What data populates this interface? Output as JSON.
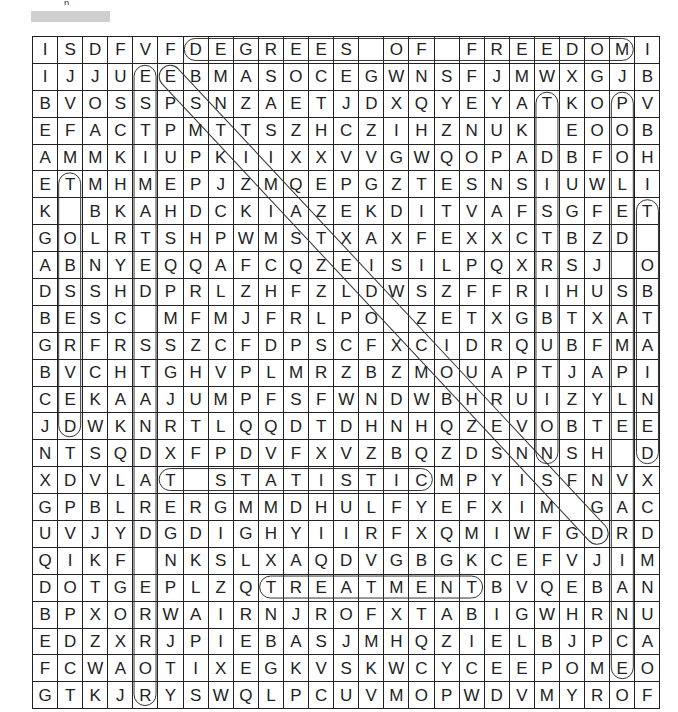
{
  "header": {
    "title_partial": "p",
    "title_placeholder_bar": true
  },
  "puzzle": {
    "type": "word-search",
    "rows": 25,
    "cols": 25,
    "grid": [
      [
        "I",
        "S",
        "D",
        "F",
        "V",
        "F",
        "D",
        "E",
        "G",
        "R",
        "E",
        "E",
        "S",
        "",
        "O",
        "F",
        "",
        "F",
        "R",
        "E",
        "E",
        "D",
        "O",
        "M",
        "I"
      ],
      [
        "I",
        "J",
        "J",
        "U",
        "E",
        "E",
        "B",
        "M",
        "A",
        "S",
        "O",
        "C",
        "E",
        "G",
        "W",
        "N",
        "S",
        "F",
        "J",
        "M",
        "W",
        "X",
        "G",
        "J",
        "B"
      ],
      [
        "B",
        "V",
        "O",
        "S",
        "S",
        "P",
        "S",
        "N",
        "Z",
        "A",
        "E",
        "T",
        "J",
        "D",
        "X",
        "Q",
        "Y",
        "E",
        "Y",
        "A",
        "T",
        "K",
        "O",
        "P",
        "V"
      ],
      [
        "E",
        "F",
        "A",
        "C",
        "T",
        "P",
        "M",
        "T",
        "T",
        "S",
        "Z",
        "H",
        "C",
        "Z",
        "I",
        "H",
        "Z",
        "N",
        "U",
        "K",
        "",
        "E",
        "O",
        "O",
        "B"
      ],
      [
        "A",
        "M",
        "M",
        "K",
        "I",
        "U",
        "P",
        "K",
        "I",
        "I",
        "X",
        "X",
        "V",
        "V",
        "G",
        "W",
        "Q",
        "O",
        "P",
        "A",
        "D",
        "B",
        "F",
        "O",
        "H"
      ],
      [
        "E",
        "T",
        "M",
        "H",
        "M",
        "E",
        "P",
        "J",
        "Z",
        "M",
        "Q",
        "E",
        "P",
        "G",
        "Z",
        "T",
        "E",
        "S",
        "N",
        "S",
        "I",
        "U",
        "W",
        "L",
        "I"
      ],
      [
        "K",
        "",
        "B",
        "K",
        "A",
        "H",
        "D",
        "C",
        "K",
        "I",
        "A",
        "Z",
        "E",
        "K",
        "D",
        "I",
        "T",
        "V",
        "A",
        "F",
        "S",
        "G",
        "F",
        "E",
        "T"
      ],
      [
        "G",
        "O",
        "L",
        "R",
        "T",
        "S",
        "H",
        "P",
        "W",
        "M",
        "S",
        "T",
        "X",
        "A",
        "X",
        "F",
        "E",
        "X",
        "X",
        "C",
        "T",
        "B",
        "Z",
        "D",
        ""
      ],
      [
        "A",
        "B",
        "N",
        "Y",
        "E",
        "Q",
        "Q",
        "A",
        "F",
        "C",
        "Q",
        "Z",
        "E",
        "I",
        "S",
        "I",
        "L",
        "P",
        "Q",
        "X",
        "R",
        "S",
        "J",
        "",
        "O"
      ],
      [
        "D",
        "S",
        "S",
        "H",
        "D",
        "P",
        "R",
        "L",
        "Z",
        "H",
        "F",
        "Z",
        "L",
        "D",
        "W",
        "S",
        "Z",
        "F",
        "F",
        "R",
        "I",
        "H",
        "U",
        "S",
        "B"
      ],
      [
        "B",
        "E",
        "S",
        "C",
        "",
        "M",
        "F",
        "M",
        "J",
        "F",
        "R",
        "L",
        "P",
        "O",
        "",
        "Z",
        "E",
        "T",
        "X",
        "G",
        "B",
        "T",
        "X",
        "A",
        "T"
      ],
      [
        "G",
        "R",
        "F",
        "R",
        "S",
        "S",
        "Z",
        "C",
        "F",
        "D",
        "P",
        "S",
        "C",
        "F",
        "X",
        "C",
        "I",
        "D",
        "R",
        "Q",
        "U",
        "B",
        "F",
        "M",
        "A"
      ],
      [
        "B",
        "V",
        "C",
        "H",
        "T",
        "G",
        "H",
        "V",
        "P",
        "L",
        "M",
        "R",
        "Z",
        "B",
        "Z",
        "M",
        "O",
        "U",
        "A",
        "P",
        "T",
        "J",
        "A",
        "P",
        "I"
      ],
      [
        "C",
        "E",
        "K",
        "A",
        "A",
        "J",
        "U",
        "M",
        "P",
        "F",
        "S",
        "F",
        "W",
        "N",
        "D",
        "W",
        "B",
        "H",
        "R",
        "U",
        "I",
        "Z",
        "Y",
        "L",
        "N"
      ],
      [
        "J",
        "D",
        "W",
        "K",
        "N",
        "R",
        "T",
        "L",
        "Q",
        "Q",
        "D",
        "T",
        "D",
        "H",
        "N",
        "H",
        "Q",
        "Z",
        "E",
        "V",
        "O",
        "B",
        "T",
        "E",
        "E"
      ],
      [
        "N",
        "T",
        "S",
        "Q",
        "D",
        "X",
        "F",
        "P",
        "D",
        "V",
        "F",
        "X",
        "V",
        "Z",
        "B",
        "Q",
        "Z",
        "D",
        "S",
        "N",
        "N",
        "S",
        "H",
        "",
        "D"
      ],
      [
        "X",
        "D",
        "V",
        "L",
        "A",
        "T",
        "",
        "S",
        "T",
        "A",
        "T",
        "I",
        "S",
        "T",
        "I",
        "C",
        "M",
        "P",
        "Y",
        "I",
        "S",
        "F",
        "N",
        "V",
        "X"
      ],
      [
        "G",
        "P",
        "B",
        "L",
        "R",
        "E",
        "R",
        "G",
        "M",
        "M",
        "D",
        "H",
        "U",
        "L",
        "F",
        "Y",
        "E",
        "F",
        "X",
        "I",
        "M",
        "",
        "G",
        "A",
        "C"
      ],
      [
        "U",
        "V",
        "J",
        "Y",
        "D",
        "G",
        "D",
        "I",
        "G",
        "H",
        "Y",
        "I",
        "I",
        "R",
        "F",
        "X",
        "Q",
        "M",
        "I",
        "W",
        "F",
        "G",
        "D",
        "R",
        "D"
      ],
      [
        "Q",
        "I",
        "K",
        "F",
        "",
        "N",
        "K",
        "S",
        "L",
        "X",
        "A",
        "Q",
        "D",
        "V",
        "G",
        "B",
        "G",
        "K",
        "C",
        "E",
        "F",
        "V",
        "J",
        "I",
        "M"
      ],
      [
        "D",
        "O",
        "T",
        "G",
        "E",
        "P",
        "L",
        "Z",
        "Q",
        "T",
        "R",
        "E",
        "A",
        "T",
        "M",
        "E",
        "N",
        "T",
        "B",
        "V",
        "Q",
        "E",
        "B",
        "A",
        "N"
      ],
      [
        "B",
        "P",
        "X",
        "O",
        "R",
        "W",
        "A",
        "I",
        "R",
        "N",
        "J",
        "R",
        "O",
        "F",
        "X",
        "T",
        "A",
        "B",
        "I",
        "G",
        "W",
        "H",
        "R",
        "N",
        "U"
      ],
      [
        "E",
        "D",
        "Z",
        "X",
        "R",
        "J",
        "P",
        "I",
        "E",
        "B",
        "A",
        "S",
        "J",
        "M",
        "H",
        "Q",
        "Z",
        "I",
        "E",
        "L",
        "B",
        "J",
        "P",
        "C",
        "A"
      ],
      [
        "F",
        "C",
        "W",
        "A",
        "O",
        "T",
        "I",
        "X",
        "E",
        "G",
        "K",
        "V",
        "S",
        "K",
        "W",
        "C",
        "Y",
        "C",
        "E",
        "E",
        "P",
        "O",
        "M",
        "E",
        "O"
      ],
      [
        "G",
        "T",
        "K",
        "J",
        "R",
        "Y",
        "S",
        "W",
        "Q",
        "L",
        "P",
        "C",
        "U",
        "V",
        "M",
        "O",
        "P",
        "W",
        "D",
        "V",
        "M",
        "Y",
        "R",
        "O",
        "F"
      ]
    ],
    "found_words": [
      {
        "word": "DEGREES OF FREEDOM",
        "direction": "horizontal",
        "start": [
          0,
          6
        ],
        "end": [
          0,
          23
        ]
      },
      {
        "word": "T STATISTIC",
        "direction": "horizontal",
        "start": [
          16,
          5
        ],
        "end": [
          16,
          15
        ]
      },
      {
        "word": "TREATMENT",
        "direction": "horizontal",
        "start": [
          20,
          9
        ],
        "end": [
          20,
          17
        ]
      },
      {
        "word": "ESTIMATED STANDARD ERROR",
        "direction": "vertical",
        "start": [
          1,
          4
        ],
        "end": [
          24,
          4
        ]
      },
      {
        "word": "T OBSERVED",
        "direction": "vertical",
        "start": [
          5,
          1
        ],
        "end": [
          14,
          1
        ]
      },
      {
        "word": "T DISTRIBUTION",
        "direction": "vertical",
        "start": [
          2,
          20
        ],
        "end": [
          15,
          20
        ]
      },
      {
        "word": "POOLED SAMPLE VARIANCE",
        "direction": "vertical",
        "start": [
          2,
          23
        ],
        "end": [
          23,
          23
        ]
      },
      {
        "word": "T OBTAINED",
        "direction": "vertical",
        "start": [
          6,
          24
        ],
        "end": [
          15,
          24
        ]
      },
      {
        "word": "ESTIMATED STANDARD",
        "direction": "diagonal",
        "start": [
          1,
          5
        ],
        "end": [
          18,
          22
        ]
      }
    ]
  },
  "style": {
    "grid_line_color": "#222222",
    "letter_color": "#222222",
    "oval_color": "#333333",
    "background": "#ffffff"
  }
}
